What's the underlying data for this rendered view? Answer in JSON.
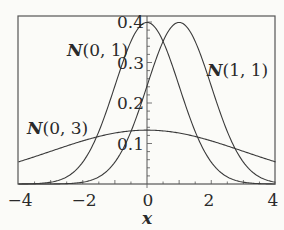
{
  "chart_data": {
    "type": "line",
    "title": "",
    "xlabel": "x",
    "ylabel": "",
    "xlim": [
      -4,
      4
    ],
    "ylim": [
      0,
      0.415
    ],
    "grid": false,
    "x_ticks": [
      -4,
      -2,
      0,
      2,
      4
    ],
    "x_tick_labels": [
      "−4",
      "−2",
      "0",
      "2",
      "4"
    ],
    "y_ticks": [
      0.1,
      0.2,
      0.3,
      0.4
    ],
    "y_tick_labels": [
      "0.1",
      "0.2",
      "0.3",
      "0.4"
    ],
    "y_axis_at_x": 0,
    "series": [
      {
        "name": "N(0, 1)",
        "mu": 0,
        "sigma": 1,
        "x": [
          -4,
          -3,
          -2,
          -1,
          0,
          1,
          2,
          3,
          4
        ],
        "values": [
          0.0001,
          0.0044,
          0.054,
          0.242,
          0.399,
          0.242,
          0.054,
          0.0044,
          0.0001
        ]
      },
      {
        "name": "N(1, 1)",
        "mu": 1,
        "sigma": 1,
        "x": [
          -4,
          -3,
          -2,
          -1,
          0,
          1,
          2,
          3,
          4
        ],
        "values": [
          0.0,
          0.0001,
          0.0044,
          0.054,
          0.242,
          0.399,
          0.242,
          0.054,
          0.0044
        ]
      },
      {
        "name": "N(0, 3)",
        "mu": 0,
        "sigma": 3,
        "x": [
          -4,
          -3,
          -2,
          -1,
          0,
          1,
          2,
          3,
          4
        ],
        "values": [
          0.055,
          0.081,
          0.106,
          0.126,
          0.133,
          0.126,
          0.106,
          0.081,
          0.055
        ]
      }
    ],
    "annotations": [
      {
        "text": "N(0, 1)",
        "x": -1.4,
        "y": 0.35
      },
      {
        "text": "N(1, 1)",
        "x": 2.7,
        "y": 0.28
      },
      {
        "text": "N(0, 3)",
        "x": -2.6,
        "y": 0.15
      }
    ]
  },
  "labels": {
    "x_axis": "x",
    "curve_n01": {
      "name": "N",
      "args": "(0, 1)"
    },
    "curve_n11": {
      "name": "N",
      "args": "(1, 1)"
    },
    "curve_n03": {
      "name": "N",
      "args": "(0, 3)"
    }
  },
  "colors": {
    "line": "#3a3a3a",
    "frame": "#555555",
    "background": "#fbfbf8"
  }
}
